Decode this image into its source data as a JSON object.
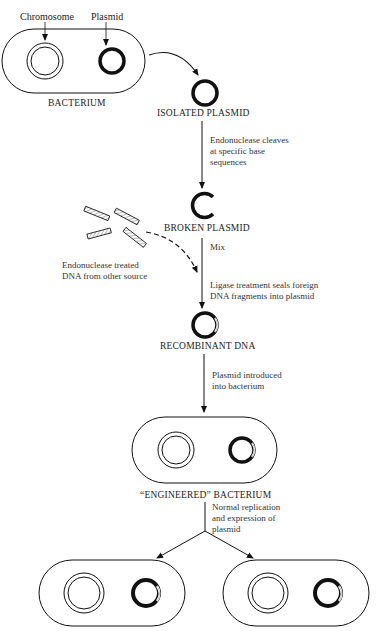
{
  "diagram": {
    "labels": {
      "chromosome": "Chromosome",
      "plasmid": "Plasmid",
      "bacterium": "BACTERIUM",
      "isolated_plasmid": "ISOLATED PLASMID",
      "broken_plasmid": "BROKEN PLASMID",
      "recombinant_dna": "RECOMBINANT DNA",
      "engineered_bacterium": "“ENGINEERED” BACTERIUM"
    },
    "steps": {
      "cleave": [
        "Endonuclease cleaves",
        "at specific base",
        "sequences"
      ],
      "mix": "Mix",
      "foreign_dna": [
        "Endonuclease treated",
        "DNA from other source"
      ],
      "ligase": [
        "Ligase treatment seals foreign",
        "DNA fragments into plasmid"
      ],
      "introduce": [
        "Plasmid introduced",
        "into bacterium"
      ],
      "replicate": [
        "Normal replication",
        "and expression of",
        "plasmid"
      ]
    },
    "colors": {
      "ink": "#111111",
      "background": "#ffffff"
    }
  }
}
